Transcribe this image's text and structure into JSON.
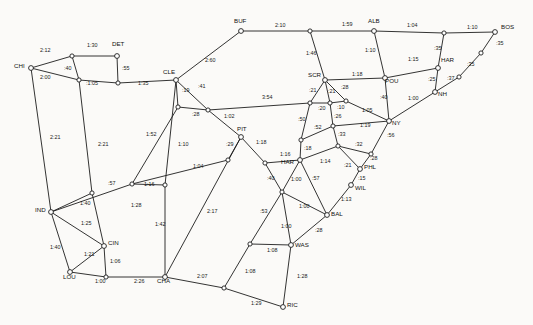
{
  "figure": {
    "type": "node-link-diagram",
    "background_color": "#fbfaf8",
    "line_color": "#1d1d1d",
    "node_fill": "#ffffff",
    "width": 533,
    "height": 325
  },
  "chart_data": {
    "type": "graph",
    "xlabel": "",
    "ylabel": "",
    "edge_label_unit": "hours:minutes",
    "cities": [
      {
        "id": "CHI",
        "label": "CHI",
        "x": 31,
        "y": 68,
        "lx": 14,
        "ly": 68
      },
      {
        "id": "DET",
        "label": "DET",
        "x": 117,
        "y": 56,
        "lx": 112,
        "ly": 46
      },
      {
        "id": "CLE",
        "label": "CLE",
        "x": 176,
        "y": 80,
        "lx": 163,
        "ly": 74
      },
      {
        "id": "BUF",
        "label": "BUF",
        "x": 241,
        "y": 31,
        "lx": 234,
        "ly": 23
      },
      {
        "id": "ALB",
        "label": "ALB",
        "x": 374,
        "y": 31,
        "lx": 368,
        "ly": 23
      },
      {
        "id": "BOS",
        "label": "BOS",
        "x": 495,
        "y": 32,
        "lx": 501,
        "ly": 29
      },
      {
        "id": "HAR_CT",
        "label": "HAR",
        "x": 438,
        "y": 68,
        "lx": 441,
        "ly": 62
      },
      {
        "id": "NH",
        "label": "NH",
        "x": 435,
        "y": 92,
        "lx": 438,
        "ly": 96
      },
      {
        "id": "POU",
        "label": "POU",
        "x": 385,
        "y": 78,
        "lx": 385,
        "ly": 83
      },
      {
        "id": "SCR",
        "label": "SCR",
        "x": 325,
        "y": 80,
        "lx": 308,
        "ly": 77
      },
      {
        "id": "NY",
        "label": "NY",
        "x": 389,
        "y": 121,
        "lx": 392,
        "ly": 125
      },
      {
        "id": "PIT",
        "label": "PIT",
        "x": 241,
        "y": 137,
        "lx": 237,
        "ly": 131
      },
      {
        "id": "PHL",
        "label": "PHL",
        "x": 360,
        "y": 169,
        "lx": 364,
        "ly": 169
      },
      {
        "id": "WIL",
        "label": "WIL",
        "x": 351,
        "y": 185,
        "lx": 355,
        "ly": 190
      },
      {
        "id": "BAL",
        "label": "BAL",
        "x": 327,
        "y": 215,
        "lx": 331,
        "ly": 216
      },
      {
        "id": "WAS",
        "label": "WAS",
        "x": 291,
        "y": 245,
        "lx": 295,
        "ly": 247
      },
      {
        "id": "RIC",
        "label": "RIC",
        "x": 283,
        "y": 307,
        "lx": 287,
        "ly": 307
      },
      {
        "id": "CHA",
        "label": "CHA",
        "x": 165,
        "y": 277,
        "lx": 157,
        "ly": 283
      },
      {
        "id": "IND",
        "label": "IND",
        "x": 51,
        "y": 212,
        "lx": 35,
        "ly": 212
      },
      {
        "id": "CIN",
        "label": "CIN",
        "x": 104,
        "y": 246,
        "lx": 108,
        "ly": 245
      },
      {
        "id": "LOU",
        "label": "LOU",
        "x": 70,
        "y": 272,
        "lx": 63,
        "ly": 279
      },
      {
        "id": "HAR_PA",
        "label": "HAR",
        "x": 300,
        "y": 160,
        "lx": 281,
        "ly": 164
      }
    ],
    "junctions": [
      {
        "id": "j_chi_det",
        "x": 72,
        "y": 56
      },
      {
        "id": "j_chi_tol",
        "x": 79,
        "y": 80
      },
      {
        "id": "j_det_s",
        "x": 118,
        "y": 83
      },
      {
        "id": "j_cle_s",
        "x": 178,
        "y": 107
      },
      {
        "id": "j_cle_e",
        "x": 208,
        "y": 110
      },
      {
        "id": "j_ind_n",
        "x": 92,
        "y": 193
      },
      {
        "id": "j_ft_wayne",
        "x": 132,
        "y": 184
      },
      {
        "id": "j_cle_sw",
        "x": 165,
        "y": 185
      },
      {
        "id": "j_pit_w",
        "x": 228,
        "y": 160
      },
      {
        "id": "j_pit_s",
        "x": 265,
        "y": 163
      },
      {
        "id": "j_scr_w",
        "x": 310,
        "y": 103
      },
      {
        "id": "j_scr_c",
        "x": 330,
        "y": 103
      },
      {
        "id": "j_scr_e",
        "x": 346,
        "y": 101
      },
      {
        "id": "j_alt",
        "x": 301,
        "y": 140
      },
      {
        "id": "j_read",
        "x": 333,
        "y": 126
      },
      {
        "id": "j_lanc",
        "x": 338,
        "y": 146
      },
      {
        "id": "j_tre",
        "x": 371,
        "y": 154
      },
      {
        "id": "j_har_s",
        "x": 282,
        "y": 192
      },
      {
        "id": "j_alb_w",
        "x": 310,
        "y": 31
      },
      {
        "id": "j_bos_w",
        "x": 444,
        "y": 33
      },
      {
        "id": "j_prov",
        "x": 481,
        "y": 53
      },
      {
        "id": "j_nh_e",
        "x": 459,
        "y": 77
      },
      {
        "id": "j_was_w",
        "x": 250,
        "y": 244
      },
      {
        "id": "j_ric_w",
        "x": 224,
        "y": 288
      }
    ],
    "edges": [
      {
        "from": "CHI",
        "to": "j_chi_det",
        "label": "2:12",
        "lx": 40,
        "ly": 52
      },
      {
        "from": "j_chi_det",
        "to": "DET",
        "label": "1:30",
        "lx": 87,
        "ly": 47
      },
      {
        "from": "CHI",
        "to": "j_chi_tol",
        "label": "2:00",
        "lx": 40,
        "ly": 79
      },
      {
        "from": "j_chi_det",
        "to": "j_chi_tol",
        "label": ":40",
        "lx": 64,
        "ly": 70
      },
      {
        "from": "j_chi_tol",
        "to": "j_det_s",
        "label": ":1:05",
        "lx": 86,
        "ly": 85
      },
      {
        "from": "DET",
        "to": "j_det_s",
        "label": ":55",
        "lx": 122,
        "ly": 70
      },
      {
        "from": "j_det_s",
        "to": "CLE",
        "label": "1:35",
        "lx": 138,
        "ly": 85
      },
      {
        "from": "CLE",
        "to": "BUF",
        "label": "2:60",
        "lx": 205,
        "ly": 62
      },
      {
        "from": "BUF",
        "to": "j_alb_w",
        "label": "2:10",
        "lx": 275,
        "ly": 27
      },
      {
        "from": "j_alb_w",
        "to": "ALB",
        "label": "1:59",
        "lx": 342,
        "ly": 26
      },
      {
        "from": "ALB",
        "to": "j_bos_w",
        "label": "1:04",
        "lx": 407,
        "ly": 27
      },
      {
        "from": "j_bos_w",
        "to": "BOS",
        "label": "1:10",
        "lx": 467,
        "ly": 29
      },
      {
        "from": "j_alb_w",
        "to": "SCR",
        "label": "1:46",
        "lx": 306,
        "ly": 55
      },
      {
        "from": "ALB",
        "to": "POU",
        "label": "1:10",
        "lx": 365,
        "ly": 52
      },
      {
        "from": "j_bos_w",
        "to": "HAR_CT",
        "label": ":35",
        "lx": 434,
        "ly": 50
      },
      {
        "from": "BOS",
        "to": "j_prov",
        "label": ":35",
        "lx": 496,
        "ly": 45
      },
      {
        "from": "j_prov",
        "to": "j_nh_e",
        "label": ":35",
        "lx": 467,
        "ly": 66
      },
      {
        "from": "j_nh_e",
        "to": "NH",
        "label": ":37",
        "lx": 447,
        "ly": 80
      },
      {
        "from": "HAR_CT",
        "to": "NH",
        "label": ":25",
        "lx": 428,
        "ly": 81
      },
      {
        "from": "POU",
        "to": "HAR_CT",
        "label": "1:15",
        "lx": 408,
        "ly": 61
      },
      {
        "from": "SCR",
        "to": "POU",
        "label": "1:18",
        "lx": 352,
        "ly": 76
      },
      {
        "from": "POU",
        "to": "NY",
        "label": ":40",
        "lx": 380,
        "ly": 99
      },
      {
        "from": "NH",
        "to": "NY",
        "label": "1:00",
        "lx": 408,
        "ly": 100
      },
      {
        "from": "SCR",
        "to": "j_scr_w",
        "label": ":21",
        "lx": 309,
        "ly": 92
      },
      {
        "from": "SCR",
        "to": "j_scr_c",
        "label": ":21",
        "lx": 328,
        "ly": 93
      },
      {
        "from": "SCR",
        "to": "j_scr_e",
        "label": ":28",
        "lx": 341,
        "ly": 89
      },
      {
        "from": "j_scr_w",
        "to": "j_scr_c",
        "label": ":20",
        "lx": 318,
        "ly": 110
      },
      {
        "from": "j_scr_c",
        "to": "j_scr_e",
        "label": ":10",
        "lx": 337,
        "ly": 109
      },
      {
        "from": "j_scr_e",
        "to": "NY",
        "label": "1:05",
        "lx": 362,
        "ly": 112
      },
      {
        "from": "j_cle_e",
        "to": "j_scr_w",
        "label": "3:54",
        "lx": 262,
        "ly": 99
      },
      {
        "from": "CLE",
        "to": "j_cle_s",
        "label": ":19",
        "lx": 182,
        "ly": 92
      },
      {
        "from": "CLE",
        "to": "j_cle_e",
        "label": ":41",
        "lx": 198,
        "ly": 88
      },
      {
        "from": "j_cle_s",
        "to": "j_cle_e",
        "label": ":28",
        "lx": 192,
        "ly": 116
      },
      {
        "from": "j_cle_e",
        "to": "PIT",
        "label": "1:02",
        "lx": 224,
        "ly": 118
      },
      {
        "from": "PIT",
        "to": "j_pit_s",
        "label": "1:18",
        "lx": 256,
        "ly": 144
      },
      {
        "from": "PIT",
        "to": "j_pit_w",
        "label": ":29",
        "lx": 226,
        "ly": 146
      },
      {
        "from": "j_scr_w",
        "to": "j_alt",
        "label": ":50",
        "lx": 298,
        "ly": 121
      },
      {
        "from": "j_scr_c",
        "to": "j_read",
        "label": ":26",
        "lx": 334,
        "ly": 118
      },
      {
        "from": "j_alt",
        "to": "j_read",
        "label": ":52",
        "lx": 314,
        "ly": 129
      },
      {
        "from": "j_read",
        "to": "NY",
        "label": "1:19",
        "lx": 360,
        "ly": 127
      },
      {
        "from": "j_read",
        "to": "j_lanc",
        "label": ":33",
        "lx": 338,
        "ly": 136
      },
      {
        "from": "j_alt",
        "to": "HAR_PA",
        "label": ":18",
        "lx": 304,
        "ly": 150
      },
      {
        "from": "HAR_PA",
        "to": "j_lanc",
        "label": "1:14",
        "lx": 320,
        "ly": 163
      },
      {
        "from": "j_lanc",
        "to": "j_tre",
        "label": ":32",
        "lx": 355,
        "ly": 146
      },
      {
        "from": "NY",
        "to": "j_tre",
        "label": ":56",
        "lx": 387,
        "ly": 137
      },
      {
        "from": "j_tre",
        "to": "PHL",
        "label": ":28",
        "lx": 370,
        "ly": 160
      },
      {
        "from": "j_lanc",
        "to": "PHL",
        "label": ":21",
        "lx": 344,
        "ly": 167
      },
      {
        "from": "PHL",
        "to": "WIL",
        "label": ":15",
        "lx": 358,
        "ly": 180
      },
      {
        "from": "WIL",
        "to": "BAL",
        "label": "1:13",
        "lx": 341,
        "ly": 201
      },
      {
        "from": "j_pit_s",
        "to": "HAR_PA",
        "label": "1:16",
        "lx": 280,
        "ly": 156
      },
      {
        "from": "HAR_PA",
        "to": "j_har_s",
        "label": "1:00",
        "lx": 291,
        "ly": 181
      },
      {
        "from": "HAR_PA",
        "to": "BAL",
        "label": ":57",
        "lx": 312,
        "ly": 180
      },
      {
        "from": "j_pit_s",
        "to": "j_har_s",
        "label": ":40",
        "lx": 267,
        "ly": 180
      },
      {
        "from": "j_har_s",
        "to": "BAL",
        "label": "1:00",
        "lx": 299,
        "ly": 208
      },
      {
        "from": "BAL",
        "to": "WAS",
        "label": ":28",
        "lx": 315,
        "ly": 232
      },
      {
        "from": "j_har_s",
        "to": "WAS",
        "label": "1:00",
        "lx": 281,
        "ly": 228
      },
      {
        "from": "j_har_s",
        "to": "j_was_w",
        "label": ":53",
        "lx": 260,
        "ly": 213
      },
      {
        "from": "j_was_w",
        "to": "WAS",
        "label": "1:08",
        "lx": 267,
        "ly": 252
      },
      {
        "from": "j_was_w",
        "to": "j_ric_w",
        "label": "1:08",
        "lx": 245,
        "ly": 273
      },
      {
        "from": "WAS",
        "to": "RIC",
        "label": "1:28",
        "lx": 297,
        "ly": 278
      },
      {
        "from": "j_ric_w",
        "to": "RIC",
        "label": "1:29",
        "lx": 251,
        "ly": 305
      },
      {
        "from": "CHA",
        "to": "j_ric_w",
        "label": "2:07",
        "lx": 197,
        "ly": 278
      },
      {
        "from": "PIT",
        "to": "CHA",
        "label": "2:17",
        "lx": 207,
        "ly": 213
      },
      {
        "from": "CHI",
        "to": "IND",
        "label": "2:21",
        "lx": 50,
        "ly": 139
      },
      {
        "from": "j_chi_tol",
        "to": "j_ind_n",
        "label": "2:21",
        "lx": 98,
        "ly": 146
      },
      {
        "from": "CLE",
        "to": "j_cle_sw",
        "label": "1:52",
        "lx": 146,
        "ly": 136
      },
      {
        "from": "j_cle_s",
        "to": "j_ft_wayne",
        "label": "1:10",
        "lx": 178,
        "ly": 146
      },
      {
        "from": "j_cle_sw",
        "to": "j_ft_wayne",
        "label": "1:16",
        "lx": 144,
        "ly": 186
      },
      {
        "from": "j_ft_wayne",
        "to": "j_pit_w",
        "label": "1:04",
        "lx": 193,
        "ly": 168
      },
      {
        "from": "IND",
        "to": "j_ind_n",
        "label": ":57",
        "lx": 108,
        "ly": 185
      },
      {
        "from": "IND",
        "to": "j_ft_wayne",
        "label": "1:40",
        "lx": 80,
        "ly": 205
      },
      {
        "from": "j_ind_n",
        "to": "CIN",
        "label": "1:28",
        "lx": 131,
        "ly": 207
      },
      {
        "from": "IND",
        "to": "CIN",
        "label": "1:25",
        "lx": 81,
        "ly": 225
      },
      {
        "from": "IND",
        "to": "LOU",
        "label": "1:40",
        "lx": 50,
        "ly": 249
      },
      {
        "from": "CIN",
        "to": "LOU",
        "label": "1:21",
        "lx": 84,
        "ly": 256
      },
      {
        "from": "CIN",
        "to": "j_cin_s",
        "label": "1:06",
        "lx": 110,
        "ly": 263
      },
      {
        "from": "LOU",
        "to": "j_cin_s",
        "label": "1:00",
        "lx": 95,
        "ly": 283
      },
      {
        "from": "j_cin_s",
        "to": "CHA",
        "label": "2:26",
        "lx": 134,
        "ly": 283
      },
      {
        "from": "j_cle_sw",
        "to": "CHA",
        "label": "1:42",
        "lx": 155,
        "ly": 226
      }
    ]
  }
}
